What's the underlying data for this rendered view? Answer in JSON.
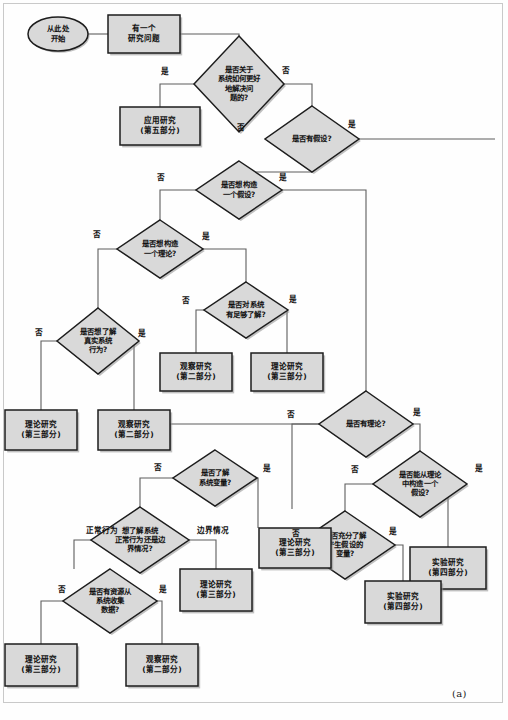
{
  "figure": {
    "caption": "(a)",
    "colors": {
      "node_fill": "#d9d9d9",
      "node_stroke": "#1d1d1d",
      "edge_stroke": "#5d5d5d",
      "shadow": "#8d8d8d",
      "page_background": "#ffffff"
    }
  },
  "chart_data": {
    "type": "diagram",
    "subtype": "flowchart",
    "title": "",
    "caption": "(a)",
    "legend": [],
    "nodes": [
      {
        "id": "start",
        "shape": "ellipse",
        "lines": [
          "从此处",
          "开始"
        ],
        "x": 58,
        "y": 34
      },
      {
        "id": "q_problem",
        "shape": "rect",
        "lines": [
          "有一个",
          "研究问题"
        ],
        "x": 144,
        "y": 34
      },
      {
        "id": "d_solve",
        "shape": "diamond",
        "lines": [
          "是否关于",
          "系统如何更好",
          "地解决问",
          "题的?"
        ],
        "x": 239,
        "y": 84
      },
      {
        "id": "t_applied",
        "shape": "rect",
        "lines": [
          "应用研究",
          "(第五部分)"
        ],
        "x": 160,
        "y": 126
      },
      {
        "id": "d_has_hyp",
        "shape": "diamond",
        "lines": [
          "是否有假设?"
        ],
        "x": 312,
        "y": 139
      },
      {
        "id": "d_want_hyp",
        "shape": "diamond",
        "lines": [
          "是否想构造",
          "一个假设?"
        ],
        "x": 239,
        "y": 190
      },
      {
        "id": "d_want_thy",
        "shape": "diamond",
        "lines": [
          "是否想构造",
          "一个理论?"
        ],
        "x": 160,
        "y": 249
      },
      {
        "id": "d_know_sys",
        "shape": "diamond",
        "lines": [
          "是否对系统",
          "有足够了解?"
        ],
        "x": 246,
        "y": 310
      },
      {
        "id": "d_real_beh",
        "shape": "diamond",
        "lines": [
          "是否想了解",
          "真实系统",
          "行为?"
        ],
        "x": 98,
        "y": 341
      },
      {
        "id": "t_obs_1",
        "shape": "rect",
        "lines": [
          "观察研究",
          "(第二部分)"
        ],
        "x": 196,
        "y": 372
      },
      {
        "id": "t_thy_1",
        "shape": "rect",
        "lines": [
          "理论研究",
          "(第三部分)"
        ],
        "x": 287,
        "y": 372
      },
      {
        "id": "t_thy_2",
        "shape": "rect",
        "lines": [
          "理论研究",
          "(第三部分)"
        ],
        "x": 41,
        "y": 430
      },
      {
        "id": "t_obs_2",
        "shape": "rect",
        "lines": [
          "观察研究",
          "(第二部分)"
        ],
        "x": 134,
        "y": 430
      },
      {
        "id": "d_has_thy",
        "shape": "diamond",
        "lines": [
          "是否有理论?"
        ],
        "x": 366,
        "y": 424
      },
      {
        "id": "d_know_var",
        "shape": "diamond",
        "lines": [
          "是否了解",
          "系统变量?"
        ],
        "x": 215,
        "y": 478
      },
      {
        "id": "d_build_hyp",
        "shape": "diamond",
        "lines": [
          "是否能从理论",
          "中构造一个",
          "假设?"
        ],
        "x": 420,
        "y": 484
      },
      {
        "id": "d_norm_edge",
        "shape": "diamond",
        "lines": [
          "想了解系统",
          "正常行为还是边",
          "界情况?"
        ],
        "x": 140,
        "y": 540
      },
      {
        "id": "d_enough_var",
        "shape": "diamond",
        "lines": [
          "是否充分了解",
          "产生假设的",
          "变量?"
        ],
        "x": 345,
        "y": 545
      },
      {
        "id": "t_thy_3",
        "shape": "rect",
        "lines": [
          "理论研究",
          "(第三部分)"
        ],
        "x": 295,
        "y": 548
      },
      {
        "id": "t_exp_1",
        "shape": "rect",
        "lines": [
          "实验研究",
          "(第四部分)"
        ],
        "x": 448,
        "y": 568
      },
      {
        "id": "d_resource",
        "shape": "diamond",
        "lines": [
          "是否有资源从",
          "系统收集",
          "数据?"
        ],
        "x": 110,
        "y": 601
      },
      {
        "id": "t_thy_4",
        "shape": "rect",
        "lines": [
          "理论研究",
          "(第三部分)"
        ],
        "x": 216,
        "y": 590
      },
      {
        "id": "t_exp_2",
        "shape": "rect",
        "lines": [
          "实验研究",
          "(第四部分)"
        ],
        "x": 403,
        "y": 602
      },
      {
        "id": "t_thy_5",
        "shape": "rect",
        "lines": [
          "理论研究",
          "(第三部分)"
        ],
        "x": 41,
        "y": 665
      },
      {
        "id": "t_obs_3",
        "shape": "rect",
        "lines": [
          "观察研究",
          "(第二部分)"
        ],
        "x": 162,
        "y": 665
      }
    ],
    "edges": [
      {
        "from": "start",
        "to": "q_problem",
        "label": ""
      },
      {
        "from": "q_problem",
        "to": "d_solve",
        "label": ""
      },
      {
        "from": "d_solve",
        "to": "t_applied",
        "label": "是"
      },
      {
        "from": "d_solve",
        "to": "d_has_hyp",
        "label": "否"
      },
      {
        "from": "d_has_hyp",
        "to": "edge_right",
        "label": "是"
      },
      {
        "from": "d_has_hyp",
        "to": "d_want_hyp",
        "label": "否"
      },
      {
        "from": "d_want_hyp",
        "to": "d_want_thy",
        "label": "否"
      },
      {
        "from": "d_want_hyp",
        "to": "d_has_thy",
        "label": "是"
      },
      {
        "from": "d_want_thy",
        "to": "d_real_beh",
        "label": "否"
      },
      {
        "from": "d_want_thy",
        "to": "d_know_sys",
        "label": "是"
      },
      {
        "from": "d_know_sys",
        "to": "t_obs_1",
        "label": "否"
      },
      {
        "from": "d_know_sys",
        "to": "t_thy_1",
        "label": "是"
      },
      {
        "from": "d_real_beh",
        "to": "t_thy_2",
        "label": "否"
      },
      {
        "from": "d_real_beh",
        "to": "t_obs_2",
        "label": "是"
      },
      {
        "from": "d_has_thy",
        "to": "d_know_var",
        "label": "否"
      },
      {
        "from": "d_has_thy",
        "to": "d_build_hyp",
        "label": "是"
      },
      {
        "from": "d_know_var",
        "to": "d_norm_edge",
        "label": "否"
      },
      {
        "from": "d_know_var",
        "to": "t_thy_3",
        "label": "是"
      },
      {
        "from": "d_build_hyp",
        "to": "d_enough_var",
        "label": "否"
      },
      {
        "from": "d_build_hyp",
        "to": "t_exp_1",
        "label": "是"
      },
      {
        "from": "d_enough_var",
        "to": "t_thy_3",
        "label": "否"
      },
      {
        "from": "d_enough_var",
        "to": "t_exp_2",
        "label": "是"
      },
      {
        "from": "d_norm_edge",
        "to": "d_resource",
        "label": "正常行为"
      },
      {
        "from": "d_norm_edge",
        "to": "t_thy_4",
        "label": "边界情况"
      },
      {
        "from": "d_resource",
        "to": "t_thy_5",
        "label": "否"
      },
      {
        "from": "d_resource",
        "to": "t_obs_3",
        "label": "是"
      }
    ],
    "edge_labels": [
      {
        "text": "是",
        "x": 165,
        "y": 72
      },
      {
        "text": "否",
        "x": 286,
        "y": 71
      },
      {
        "text": "否",
        "x": 241,
        "y": 128
      },
      {
        "text": "是",
        "x": 352,
        "y": 125
      },
      {
        "text": "否",
        "x": 161,
        "y": 178
      },
      {
        "text": "是",
        "x": 283,
        "y": 178
      },
      {
        "text": "否",
        "x": 97,
        "y": 235
      },
      {
        "text": "是",
        "x": 206,
        "y": 237
      },
      {
        "text": "否",
        "x": 186,
        "y": 301
      },
      {
        "text": "是",
        "x": 293,
        "y": 300
      },
      {
        "text": "否",
        "x": 39,
        "y": 333
      },
      {
        "text": "是",
        "x": 142,
        "y": 334
      },
      {
        "text": "否",
        "x": 291,
        "y": 415
      },
      {
        "text": "是",
        "x": 417,
        "y": 413
      },
      {
        "text": "否",
        "x": 158,
        "y": 468
      },
      {
        "text": "是",
        "x": 267,
        "y": 469
      },
      {
        "text": "否",
        "x": 355,
        "y": 470
      },
      {
        "text": "是",
        "x": 479,
        "y": 469
      },
      {
        "text": "否",
        "x": 296,
        "y": 534
      },
      {
        "text": "是",
        "x": 393,
        "y": 532
      },
      {
        "text": "正常行为",
        "x": 102,
        "y": 531
      },
      {
        "text": "边界情况",
        "x": 213,
        "y": 531
      },
      {
        "text": "否",
        "x": 62,
        "y": 590
      },
      {
        "text": "是",
        "x": 163,
        "y": 590
      }
    ]
  }
}
